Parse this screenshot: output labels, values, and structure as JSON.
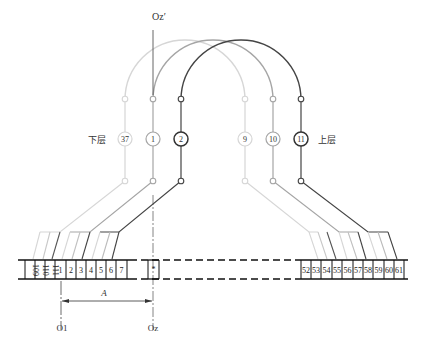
{
  "diagram": {
    "axis_top_label": "Oz′",
    "axis_bottom_label": "Oz",
    "origin_label": "O1",
    "dimension_label": "A",
    "lower_layer_label": "下层",
    "upper_layer_label": "上层",
    "coils": [
      {
        "left_number": "37",
        "right_number": "9",
        "color": "#d4d4d4"
      },
      {
        "left_number": "1",
        "right_number": "10",
        "color": "#a8a8a8"
      },
      {
        "left_number": "2",
        "right_number": "11",
        "color": "#4a4a4a"
      }
    ],
    "left_slots": [
      "109",
      "110",
      "111",
      "1",
      "2",
      "3",
      "4",
      "5",
      "6",
      "7"
    ],
    "center_slot": "*",
    "right_slots": [
      "52",
      "53",
      "54",
      "55",
      "56",
      "57",
      "58",
      "59",
      "60",
      "61"
    ],
    "colors": {
      "light": "#d4d4d4",
      "mid": "#a8a8a8",
      "dark": "#4a4a4a",
      "slot_line": "#111111"
    }
  }
}
